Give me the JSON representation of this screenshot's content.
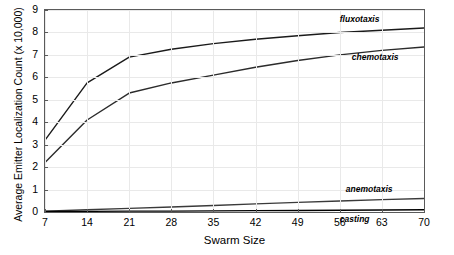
{
  "chart_data": {
    "type": "line",
    "title": "",
    "xlabel": "Swarm Size",
    "ylabel": "Average Emitter Localization Count (x 10,000)",
    "x": [
      7,
      14,
      21,
      28,
      35,
      42,
      49,
      56,
      63,
      70
    ],
    "xlim": [
      7,
      70
    ],
    "ylim": [
      0,
      9
    ],
    "xticks": [
      "7",
      "14",
      "21",
      "28",
      "35",
      "42",
      "49",
      "56",
      "63",
      "70"
    ],
    "yticks": [
      "0",
      "1",
      "2",
      "3",
      "4",
      "5",
      "6",
      "7",
      "8",
      "9"
    ],
    "grid": true,
    "legend_position": "inline-labels",
    "series": [
      {
        "name": "fluxotaxis",
        "values": [
          3.2,
          5.75,
          6.9,
          7.25,
          7.5,
          7.7,
          7.85,
          8.0,
          8.1,
          8.2
        ],
        "color": "#1a1a1a"
      },
      {
        "name": "chemotaxis",
        "values": [
          2.2,
          4.1,
          5.3,
          5.75,
          6.1,
          6.45,
          6.75,
          7.0,
          7.2,
          7.35
        ],
        "color": "#2b2b2b"
      },
      {
        "name": "anemotaxis",
        "values": [
          0.04,
          0.1,
          0.16,
          0.22,
          0.29,
          0.36,
          0.43,
          0.49,
          0.55,
          0.6
        ],
        "color": "#3a3a3a"
      },
      {
        "name": "casting",
        "values": [
          0.02,
          0.03,
          0.04,
          0.04,
          0.05,
          0.06,
          0.07,
          0.08,
          0.09,
          0.1
        ],
        "color": "#000000"
      }
    ],
    "annotations": [
      {
        "text": "fluxotaxis",
        "x": 56,
        "y": 8.55
      },
      {
        "text": "chemotaxis",
        "x": 58,
        "y": 6.85
      },
      {
        "text": "anemotaxis",
        "x": 57,
        "y": 1.0
      },
      {
        "text": "casting",
        "x": 56,
        "y": -0.35
      }
    ]
  }
}
